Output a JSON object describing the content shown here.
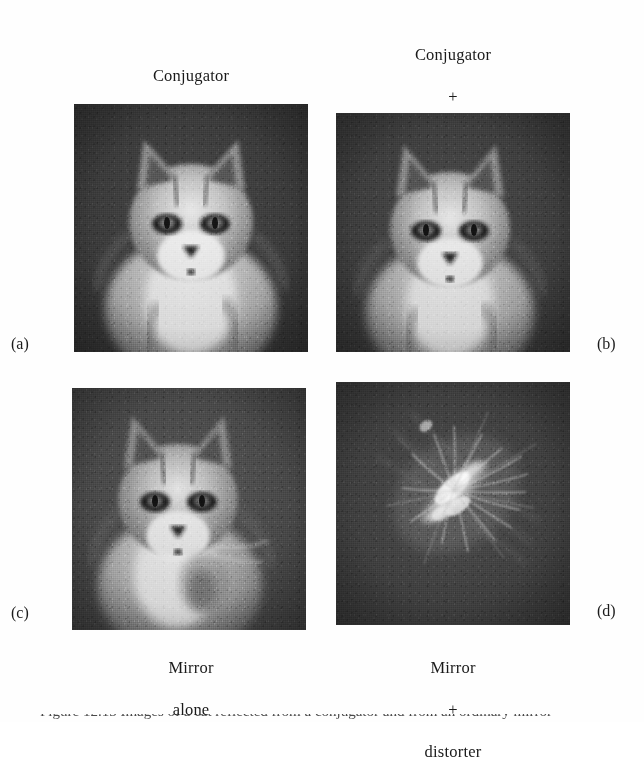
{
  "figure": {
    "background_color": "#fefefe",
    "panel_dark_tone": "#3a3a3a",
    "panel_light_tone": "#e9e9e9",
    "captions": {
      "top_left": {
        "line1": "Conjugator",
        "line2": "alone"
      },
      "top_right": {
        "line1": "Conjugator",
        "line2": "+",
        "line3": "distorter"
      },
      "bottom_left": {
        "line1": "Mirror",
        "line2": "alone"
      },
      "bottom_right": {
        "line1": "Mirror",
        "line2": "+",
        "line3": "distorter"
      }
    },
    "panel_letters": {
      "a": "(a)",
      "b": "(b)",
      "c": "(c)",
      "d": "(d)"
    },
    "panels": {
      "a": {
        "subject": "cat-portrait",
        "description": "phase conjugated image of a kitten, sharp"
      },
      "b": {
        "subject": "cat-portrait",
        "description": "phase conjugated image of a kitten through distorter, sharp"
      },
      "c": {
        "subject": "cat-portrait",
        "description": "ordinary mirror image of a kitten, sharp"
      },
      "d": {
        "subject": "distorted-speckle",
        "description": "ordinary mirror image through distorter, scrambled diagonal speckle"
      }
    },
    "bottom_caption_fragment": "Figure 12.13  Images of a cat reflected from a conjugator and from an ordinary mirror"
  }
}
